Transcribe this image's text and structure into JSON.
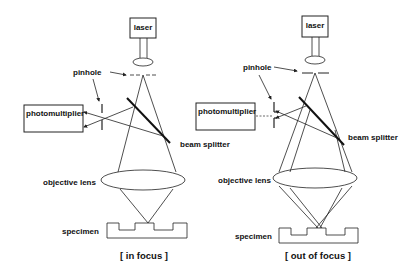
{
  "diagram": {
    "panels": [
      {
        "id": "in-focus",
        "caption": "[ in focus ]",
        "labels": {
          "laser": "laser",
          "pinhole": "pinhole",
          "photomultiplier": "photomultiplier",
          "beam_splitter": "beam splitter",
          "objective_lens": "objective lens",
          "specimen": "specimen"
        }
      },
      {
        "id": "out-of-focus",
        "caption": "[ out of focus ]",
        "labels": {
          "laser": "laser",
          "pinhole": "pinhole",
          "photomultiplier": "photomultiplier",
          "beam_splitter": "beam splitter",
          "objective_lens": "objective lens",
          "specimen": "specimen"
        }
      }
    ],
    "colors": {
      "line": "#222222",
      "background": "#ffffff"
    }
  }
}
